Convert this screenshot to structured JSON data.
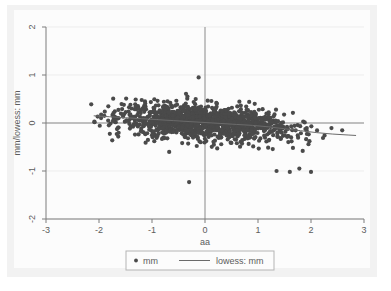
{
  "chart_data": {
    "type": "scatter",
    "title": "",
    "xlabel": "aa",
    "ylabel": "mm/lowess: mm",
    "xlim": [
      -3,
      3
    ],
    "ylim": [
      -2,
      2
    ],
    "xticks": [
      -3,
      -2,
      -1,
      0,
      1,
      2,
      3
    ],
    "xticklabels": [
      "-3",
      "-2",
      "-1",
      "0",
      "1",
      "2",
      "3"
    ],
    "yticks": [
      -2,
      -1,
      0,
      1,
      2
    ],
    "yticklabels": [
      "-2",
      "-1",
      "0",
      "1",
      "2"
    ],
    "grid": "faint-horizontal",
    "reference_lines": [
      {
        "name": "y-zero-line",
        "orientation": "horizontal",
        "value": 0
      },
      {
        "name": "x-zero-line",
        "orientation": "vertical",
        "value": 0
      }
    ],
    "legend": {
      "position": "bottom",
      "entries": [
        {
          "label": "mm",
          "marker": "dot",
          "color": "#4a4a4a"
        },
        {
          "label": "lowess: mm",
          "marker": "line",
          "color": "#6b6b6b"
        }
      ]
    },
    "series": [
      {
        "name": "mm",
        "type": "scatter",
        "marker_color": "#4a4a4a",
        "marker_size": 2.1,
        "n_points": 1400,
        "x_range": [
          -2.15,
          2.85
        ],
        "y_range": [
          -1.25,
          0.95
        ],
        "description": "Dense residual cloud centered near y=0, widest between x=-1 and x=1, mild downward trend toward the right tail.",
        "outliers": [
          {
            "x": -0.12,
            "y": 0.95
          },
          {
            "x": -0.3,
            "y": -1.23
          },
          {
            "x": 1.35,
            "y": -1.0
          },
          {
            "x": 1.6,
            "y": -1.02
          },
          {
            "x": 1.78,
            "y": -0.95
          },
          {
            "x": 2.0,
            "y": -1.02
          }
        ]
      },
      {
        "name": "lowess: mm",
        "type": "line",
        "color": "#6b6b6b",
        "x": [
          -2.1,
          -1.8,
          -1.5,
          -1.2,
          -0.9,
          -0.6,
          -0.3,
          0.0,
          0.3,
          0.6,
          0.9,
          1.2,
          1.5,
          1.8,
          2.1,
          2.4,
          2.7,
          2.85
        ],
        "y": [
          0.15,
          0.13,
          0.11,
          0.09,
          0.07,
          0.05,
          0.03,
          0.01,
          -0.01,
          -0.03,
          -0.05,
          -0.08,
          -0.12,
          -0.16,
          -0.2,
          -0.23,
          -0.25,
          -0.26
        ]
      }
    ]
  },
  "axes": {
    "x_title": "aa",
    "y_title": "mm/lowess: mm"
  }
}
